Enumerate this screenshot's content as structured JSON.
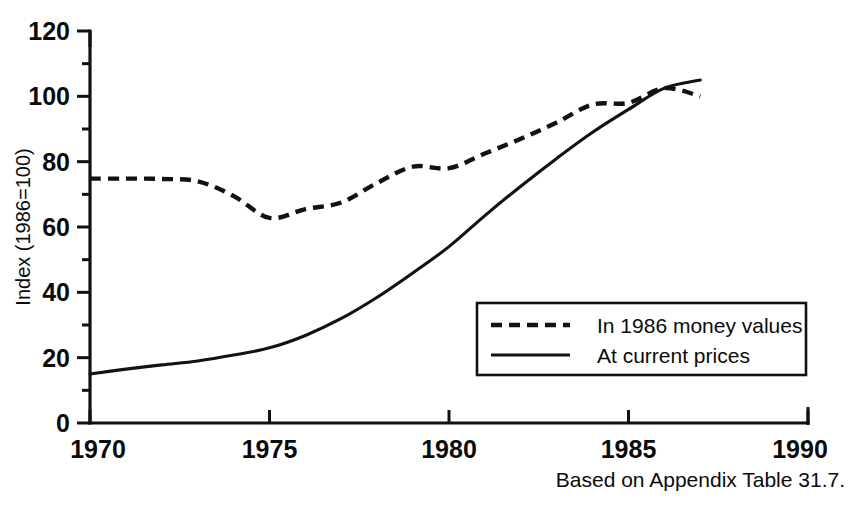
{
  "chart_data": {
    "type": "line",
    "title": "",
    "xlabel": "",
    "ylabel": "Index (1986=100)",
    "xlim": [
      1970,
      1990
    ],
    "ylim": [
      0,
      120
    ],
    "grid": false,
    "legend_position": "inside-lower-right",
    "x_ticks": [
      "1970",
      "1975",
      "1980",
      "1985",
      "1990"
    ],
    "x_tick_values": [
      1970,
      1975,
      1980,
      1985,
      1990
    ],
    "y_ticks": [
      "0",
      "20",
      "40",
      "60",
      "80",
      "100",
      "120"
    ],
    "y_tick_values": [
      0,
      20,
      40,
      60,
      80,
      100,
      120
    ],
    "y_minor_tick_values": [
      10,
      30,
      50,
      70,
      90,
      110
    ],
    "x": [
      1970,
      1971,
      1972,
      1973,
      1974,
      1975,
      1976,
      1977,
      1978,
      1979,
      1980,
      1981,
      1982,
      1983,
      1984,
      1985,
      1986,
      1987
    ],
    "series": [
      {
        "name": "In 1986 money values",
        "style": "dashed",
        "values": [
          74.8,
          74.8,
          74.7,
          74.0,
          69.5,
          62.8,
          65.5,
          67.5,
          73.5,
          78.5,
          78.0,
          82.5,
          87.0,
          92.0,
          97.5,
          98.0,
          102.5,
          100.0
        ]
      },
      {
        "name": "At current prices",
        "style": "solid",
        "values": [
          15.0,
          16.5,
          17.8,
          19.0,
          20.8,
          23.0,
          26.8,
          32.0,
          38.5,
          46.0,
          54.0,
          63.5,
          72.5,
          81.0,
          89.0,
          96.0,
          102.5,
          105.0
        ]
      }
    ]
  },
  "legend": {
    "items": [
      {
        "label": "In 1986 money values",
        "style": "dashed"
      },
      {
        "label": "At current prices",
        "style": "solid"
      }
    ]
  },
  "caption": {
    "text": "Based on Appendix Table 31.7."
  }
}
